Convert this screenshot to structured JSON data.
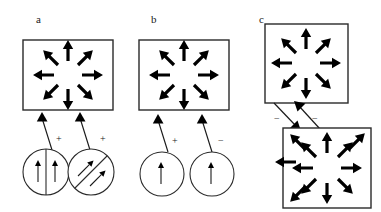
{
  "figure": {
    "width": 381,
    "height": 212,
    "background": "#ffffff",
    "ink": "#000000",
    "outline_color": "#2a2a2a"
  },
  "panels": [
    {
      "id": "a",
      "label": "a",
      "label_x": 36,
      "label_y": 14,
      "box": {
        "x": 23,
        "y": 40,
        "w": 90,
        "h": 70
      },
      "pattern": "radial-outward-8",
      "sources": [
        {
          "id": "a-left-circle",
          "cx": 46,
          "cy": 172,
          "r": 23,
          "divider": "vertical",
          "arrows": [
            {
              "dir": "up",
              "sign": "+"
            },
            {
              "dir": "up",
              "sign": "−"
            }
          ],
          "connector_sign": "+",
          "connector_sign_x": 56,
          "connector_sign_y": 134
        },
        {
          "id": "a-right-circle",
          "cx": 91,
          "cy": 172,
          "r": 23,
          "divider": "diagonal",
          "arrows": [
            {
              "dir": "up-right",
              "sign": "+"
            },
            {
              "dir": "up-right",
              "sign": "−"
            }
          ],
          "connector_sign": "+",
          "connector_sign_x": 100,
          "connector_sign_y": 134
        }
      ]
    },
    {
      "id": "b",
      "label": "b",
      "label_x": 151,
      "label_y": 14,
      "box": {
        "x": 139,
        "y": 40,
        "w": 90,
        "h": 70
      },
      "pattern": "radial-outward-8",
      "sources": [
        {
          "id": "b-left-circle",
          "cx": 162,
          "cy": 174,
          "r": 22,
          "divider": "none",
          "arrows": [
            {
              "dir": "up",
              "sign": "+"
            }
          ],
          "connector_sign": "+",
          "connector_sign_x": 172,
          "connector_sign_y": 136
        },
        {
          "id": "b-right-circle",
          "cx": 212,
          "cy": 174,
          "r": 22,
          "divider": "none",
          "arrows": [
            {
              "dir": "up",
              "sign": "+"
            }
          ],
          "connector_sign": "−",
          "connector_sign_x": 218,
          "connector_sign_y": 136
        }
      ]
    },
    {
      "id": "c",
      "label": "c",
      "label_x": 259,
      "label_y": 14,
      "box_top": {
        "x": 265,
        "y": 24,
        "w": 83,
        "h": 79
      },
      "box_bottom": {
        "x": 283,
        "y": 128,
        "w": 88,
        "h": 80
      },
      "pattern_top": "radial-outward-8",
      "pattern_bottom": "radial-outward-12",
      "connectors": [
        {
          "id": "c-down-arrow",
          "sign": "−",
          "sign_x": 274,
          "sign_y": 116
        },
        {
          "id": "c-up-arrow",
          "sign": "−",
          "sign_x": 312,
          "sign_y": 116
        }
      ]
    }
  ]
}
